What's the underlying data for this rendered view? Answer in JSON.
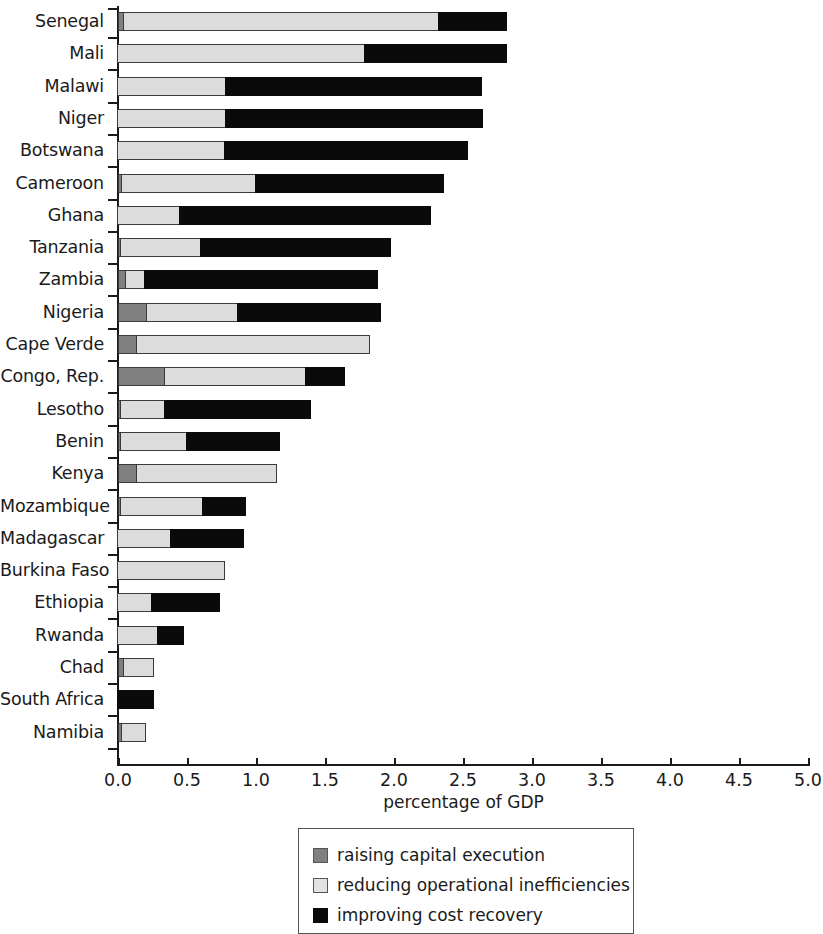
{
  "chart_data": {
    "type": "bar",
    "orientation": "horizontal",
    "stacked": true,
    "title": "",
    "xlabel": "percentage of GDP",
    "ylabel": "",
    "xlim": [
      0.0,
      5.0
    ],
    "xticks": [
      "0.0",
      "0.5",
      "1.0",
      "1.5",
      "2.0",
      "2.5",
      "3.0",
      "3.5",
      "4.0",
      "4.5",
      "5.0"
    ],
    "xtick_values": [
      0.0,
      0.5,
      1.0,
      1.5,
      2.0,
      2.5,
      3.0,
      3.5,
      4.0,
      4.5,
      5.0
    ],
    "grid": false,
    "legend_position": "below-center",
    "categories": [
      "Senegal",
      "Mali",
      "Malawi",
      "Niger",
      "Botswana",
      "Cameroon",
      "Ghana",
      "Tanzania",
      "Zambia",
      "Nigeria",
      "Cape Verde",
      "Congo, Rep.",
      "Lesotho",
      "Benin",
      "Kenya",
      "Mozambique",
      "Madagascar",
      "Burkina Faso",
      "Ethiopia",
      "Rwanda",
      "Chad",
      "South Africa",
      "Namibia"
    ],
    "series": [
      {
        "name": "raising capital execution",
        "color": "#808080",
        "values": [
          0.04,
          0.0,
          0.0,
          0.0,
          0.0,
          0.03,
          0.0,
          0.02,
          0.06,
          0.21,
          0.14,
          0.34,
          0.02,
          0.02,
          0.14,
          0.02,
          0.0,
          0.0,
          0.0,
          0.0,
          0.04,
          0.0,
          0.03
        ]
      },
      {
        "name": "reducing operational inefficiencies",
        "color": "#dcdcdc",
        "values": [
          2.29,
          1.8,
          0.79,
          0.79,
          0.78,
          0.98,
          0.46,
          0.59,
          0.14,
          0.67,
          1.69,
          1.03,
          0.33,
          0.49,
          1.02,
          0.6,
          0.39,
          0.78,
          0.25,
          0.3,
          0.23,
          0.0,
          0.18
        ]
      },
      {
        "name": "improving cost recovery",
        "color": "#0a0a0a",
        "values": [
          0.5,
          1.03,
          1.86,
          1.87,
          1.77,
          1.37,
          1.82,
          1.38,
          1.7,
          1.04,
          0.0,
          0.29,
          1.06,
          0.68,
          0.0,
          0.32,
          0.54,
          0.0,
          0.5,
          0.19,
          0.0,
          0.27,
          0.0
        ]
      }
    ],
    "totals": [
      2.83,
      2.83,
      2.65,
      2.66,
      2.55,
      2.38,
      2.28,
      1.99,
      1.9,
      1.92,
      1.83,
      1.66,
      1.41,
      1.19,
      1.16,
      0.94,
      0.93,
      0.78,
      0.75,
      0.49,
      0.27,
      0.27,
      0.21
    ]
  },
  "legend": {
    "items": [
      {
        "label": "raising capital execution",
        "swatch": "capital"
      },
      {
        "label": "reducing operational inefficiencies",
        "swatch": "operational"
      },
      {
        "label": "improving cost recovery",
        "swatch": "recovery"
      }
    ]
  }
}
